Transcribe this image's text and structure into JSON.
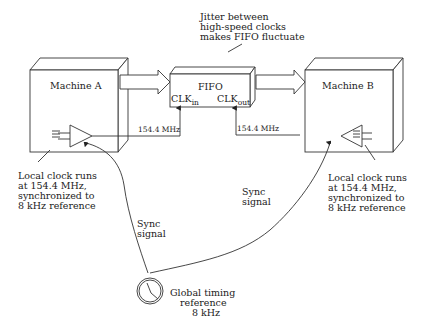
{
  "diagram": {
    "machine_a": {
      "label": "Machine A"
    },
    "machine_b": {
      "label": "Machine B"
    },
    "fifo": {
      "label": "FIFO",
      "clk_in": {
        "base": "CLK",
        "sub": "in"
      },
      "clk_out": {
        "base": "CLK",
        "sub": "out"
      }
    },
    "jitter_note": {
      "lines": [
        "Jitter between",
        "high-speed clocks",
        "makes FIFO fluctuate"
      ]
    },
    "freq_a": "154.4 MHz",
    "freq_b": "154.4 MHz",
    "local_clock_a": {
      "lines": [
        "Local clock runs",
        "at 154.4 MHz,",
        "synchronized to",
        "8 kHz reference"
      ]
    },
    "local_clock_b": {
      "lines": [
        "Local clock runs",
        "at 154.4 MHz,",
        "synchronized to",
        "8 kHz reference"
      ]
    },
    "sync_a": {
      "lines": [
        "Sync",
        "signal"
      ]
    },
    "sync_b": {
      "lines": [
        "Sync",
        "signal"
      ]
    },
    "global_ref": {
      "lines": [
        "Global timing",
        "reference",
        "8 kHz"
      ],
      "icon": "clock-icon"
    },
    "colors": {
      "line": "#333333",
      "text": "#222222",
      "background": "#ffffff"
    }
  }
}
